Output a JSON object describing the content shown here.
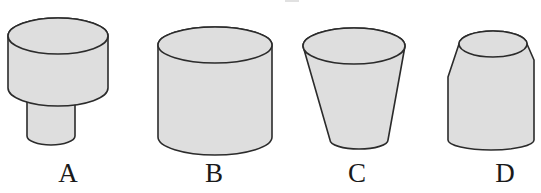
{
  "figure": {
    "background_color": "#ffffff",
    "fill_color": "#dedede",
    "outline_color": "#2b2b2b",
    "width": 541,
    "height": 193
  },
  "shapes": [
    {
      "id": "A",
      "label": "A",
      "description": "wide short cylinder stacked on a narrower taller cylinder",
      "label_x": 48,
      "label_y": 160
    },
    {
      "id": "B",
      "label": "B",
      "description": "plain right circular cylinder",
      "label_x": 194,
      "label_y": 160
    },
    {
      "id": "C",
      "label": "C",
      "description": "truncated cone, wide at top tapering to a narrow base",
      "label_x": 337,
      "label_y": 160
    },
    {
      "id": "D",
      "label": "D",
      "description": "narrow top frustum flaring out to a shoulder then tapering to the base",
      "label_x": 485,
      "label_y": 160
    }
  ]
}
